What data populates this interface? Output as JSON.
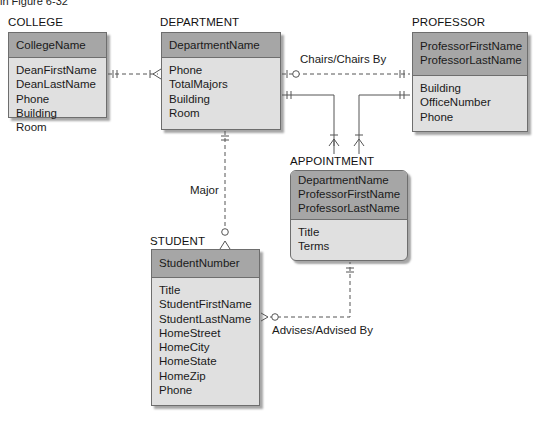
{
  "caption": "in Figure 6-32",
  "entities": {
    "college": {
      "title": "COLLEGE",
      "keys": [
        "CollegeName"
      ],
      "attributes": [
        "DeanFirstName",
        "DeanLastName",
        "Phone",
        "Building",
        "Room"
      ]
    },
    "department": {
      "title": "DEPARTMENT",
      "keys": [
        "DepartmentName"
      ],
      "attributes": [
        "Phone",
        "TotalMajors",
        "Building",
        "Room"
      ]
    },
    "professor": {
      "title": "PROFESSOR",
      "keys": [
        "ProfessorFirstName",
        "ProfessorLastName"
      ],
      "attributes": [
        "Building",
        "OfficeNumber",
        "Phone"
      ]
    },
    "appointment": {
      "title": "APPOINTMENT",
      "keys": [
        "DepartmentName",
        "ProfessorFirstName",
        "ProfessorLastName"
      ],
      "attributes": [
        "Title",
        "Terms"
      ]
    },
    "student": {
      "title": "STUDENT",
      "keys": [
        "StudentNumber"
      ],
      "attributes": [
        "Title",
        "StudentFirstName",
        "StudentLastName",
        "HomeStreet",
        "HomeCity",
        "HomeState",
        "HomeZip",
        "Phone"
      ]
    }
  },
  "relationships": {
    "chairs": "Chairs/Chairs By",
    "major": "Major",
    "advises": "Advises/Advised By"
  },
  "colors": {
    "key_fill": "#a6a6a6",
    "attr_fill": "#e0e0e0",
    "border": "#6e6e6e",
    "line": "#555555"
  }
}
